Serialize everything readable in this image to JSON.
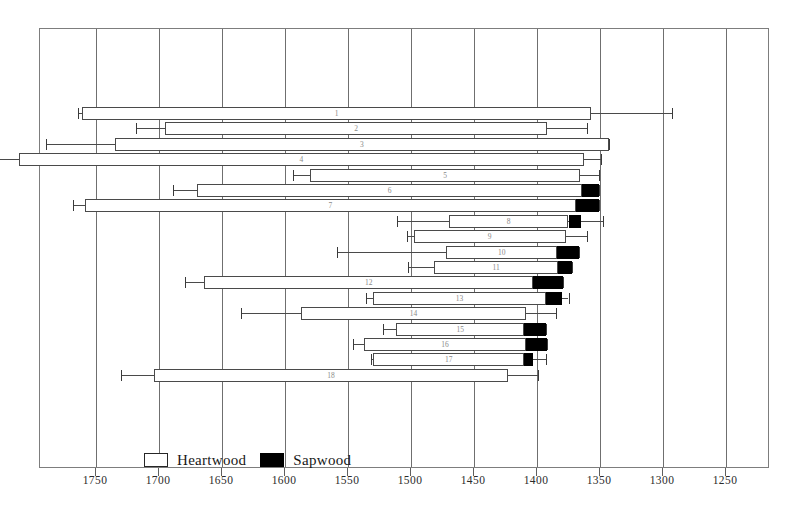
{
  "chart_data": {
    "type": "bar",
    "title": "",
    "xlabel": "",
    "ylabel": "",
    "orientation": "horizontal",
    "axis_reversed": true,
    "xlim": [
      1780,
      1230
    ],
    "grid": true,
    "tick_labels": [
      "1750",
      "1700",
      "1650",
      "1600",
      "1550",
      "1500",
      "1450",
      "1400",
      "1350",
      "1300",
      "1250"
    ],
    "tick_values": [
      1750,
      1700,
      1650,
      1600,
      1550,
      1500,
      1450,
      1400,
      1350,
      1300,
      1250
    ],
    "legend": {
      "position": "bottom-left",
      "entries": [
        {
          "label": "Heartwood",
          "color": "#ffffff",
          "swatch": "open-rectangle"
        },
        {
          "label": "Sapwood",
          "color": "#000000",
          "swatch": "filled-rectangle"
        }
      ]
    },
    "categories": [
      "1",
      "2",
      "3",
      "4",
      "5",
      "6",
      "7",
      "8",
      "9",
      "10",
      "11",
      "12",
      "13",
      "14",
      "15",
      "16",
      "17",
      "18"
    ],
    "series_note": "Each row: heartwood bar span, optional sapwood block, and error-bar whiskers at both ends (estimated felling range).",
    "rows": [
      {
        "id": "1",
        "whisker_start": 1764,
        "bar_start": 1761,
        "heartwood_end": 1357,
        "sapwood_end": null,
        "whisker_end": 1293
      },
      {
        "id": "2",
        "whisker_start": 1718,
        "bar_start": 1695,
        "heartwood_end": 1392,
        "sapwood_end": null,
        "whisker_end": 1360
      },
      {
        "id": "3",
        "whisker_start": 1790,
        "bar_start": 1735,
        "heartwood_end": 1343,
        "sapwood_end": null,
        "whisker_end": 1343
      },
      {
        "id": "4",
        "whisker_start": 1838,
        "bar_start": 1811,
        "heartwood_end": 1363,
        "sapwood_end": null,
        "whisker_end": 1349
      },
      {
        "id": "5",
        "whisker_start": 1594,
        "bar_start": 1580,
        "heartwood_end": 1366,
        "sapwood_end": null,
        "whisker_end": 1351
      },
      {
        "id": "6",
        "whisker_start": 1689,
        "bar_start": 1670,
        "heartwood_end": 1364,
        "sapwood_end": 1351,
        "whisker_end": 1351
      },
      {
        "id": "7",
        "whisker_start": 1768,
        "bar_start": 1759,
        "heartwood_end": 1369,
        "sapwood_end": 1351,
        "whisker_end": 1351
      },
      {
        "id": "8",
        "whisker_start": 1511,
        "bar_start": 1470,
        "heartwood_end": 1375,
        "sapwood_end": 1365,
        "whisker_end": 1348
      },
      {
        "id": "9",
        "whisker_start": 1503,
        "bar_start": 1498,
        "heartwood_end": 1377,
        "sapwood_end": null,
        "whisker_end": 1360
      },
      {
        "id": "10",
        "whisker_start": 1559,
        "bar_start": 1472,
        "heartwood_end": 1384,
        "sapwood_end": 1367,
        "whisker_end": 1367
      },
      {
        "id": "11",
        "whisker_start": 1502,
        "bar_start": 1482,
        "heartwood_end": 1383,
        "sapwood_end": 1372,
        "whisker_end": 1372
      },
      {
        "id": "12",
        "whisker_start": 1679,
        "bar_start": 1664,
        "heartwood_end": 1403,
        "sapwood_end": 1379,
        "whisker_end": 1379
      },
      {
        "id": "13",
        "whisker_start": 1536,
        "bar_start": 1530,
        "heartwood_end": 1393,
        "sapwood_end": 1380,
        "whisker_end": 1375
      },
      {
        "id": "14",
        "whisker_start": 1635,
        "bar_start": 1587,
        "heartwood_end": 1409,
        "sapwood_end": null,
        "whisker_end": 1385
      },
      {
        "id": "15",
        "whisker_start": 1522,
        "bar_start": 1512,
        "heartwood_end": 1410,
        "sapwood_end": 1393,
        "whisker_end": 1393
      },
      {
        "id": "16",
        "whisker_start": 1546,
        "bar_start": 1537,
        "heartwood_end": 1409,
        "sapwood_end": 1392,
        "whisker_end": 1392
      },
      {
        "id": "17",
        "whisker_start": 1532,
        "bar_start": 1530,
        "heartwood_end": 1410,
        "sapwood_end": 1403,
        "whisker_end": 1393
      },
      {
        "id": "18",
        "whisker_start": 1730,
        "bar_start": 1704,
        "heartwood_end": 1423,
        "sapwood_end": null,
        "whisker_end": 1399
      }
    ]
  }
}
